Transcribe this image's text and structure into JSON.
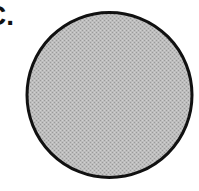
{
  "figure": {
    "panel_label": "C.",
    "shape": "circle",
    "fill_color": "#b8b8b8",
    "stroke_color": "#111111"
  }
}
